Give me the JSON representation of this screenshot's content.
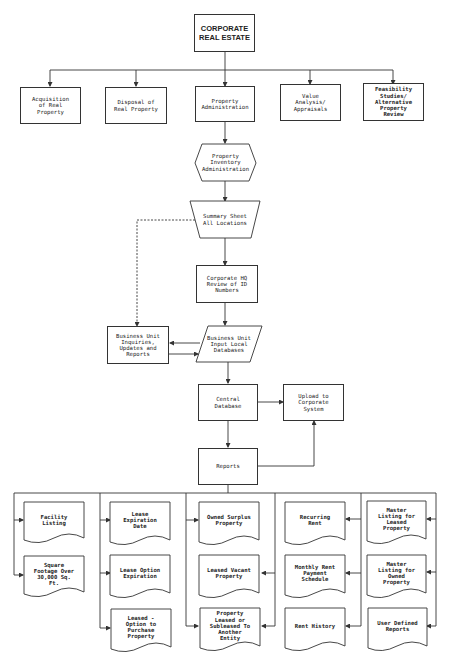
{
  "diagram": {
    "title_partial": "",
    "root": {
      "label": "CORPORATE\nREAL ESTATE"
    },
    "level1": [
      {
        "label": "Acquisition\nof Real\nProperty"
      },
      {
        "label": "Disposal of\nReal Property"
      },
      {
        "label": "Property\nAdministration"
      },
      {
        "label": "Value\nAnalysis/\nAppraisals"
      },
      {
        "label": "Feasibility\nStudies/\nAlternative\nProperty\nReview"
      }
    ],
    "flow": {
      "inventory": {
        "label": "Property\nInventory\nAdministration",
        "shape": "hexagon"
      },
      "summary": {
        "label": "Summary Sheet\nAll Locations",
        "shape": "trapezoid"
      },
      "hq_review": {
        "label": "Corporate HQ\nReview of ID\nNumbers",
        "shape": "rectangle"
      },
      "bu_inquiries": {
        "label": "Business Unit\nInquiries,\nUpdates and\nReports",
        "shape": "rectangle"
      },
      "bu_input": {
        "label": "Business Unit\nInput Local\nDatabases",
        "shape": "parallelogram"
      },
      "central_db": {
        "label": "Central\nDatabase",
        "shape": "rectangle"
      },
      "upload": {
        "label": "Upload to\nCorporate\nSystem",
        "shape": "rectangle"
      },
      "reports": {
        "label": "Reports",
        "shape": "rectangle"
      }
    },
    "report_columns": [
      {
        "items": [
          {
            "label": "Facility\nListing"
          },
          {
            "label": "Square\nFootage Over\n30,000 Sq.\nFt."
          }
        ]
      },
      {
        "items": [
          {
            "label": "Lease\nExpiration\nDate"
          },
          {
            "label": "Lease Option\nExpiration"
          },
          {
            "label": "Leased -\nOption to\nPurchase\nProperty"
          }
        ]
      },
      {
        "items": [
          {
            "label": "Owned Surplus\nProperty"
          },
          {
            "label": "Leased Vacant\nProperty"
          },
          {
            "label": "Property\nLeased or\nSubleased To\nAnother\nEntity"
          }
        ]
      },
      {
        "items": [
          {
            "label": "Recurring\nRent"
          },
          {
            "label": "Monthly Rent\nPayment\nSchedule"
          },
          {
            "label": "Rent History"
          }
        ]
      },
      {
        "items": [
          {
            "label": "Master\nListing for\nLeased\nProperty"
          },
          {
            "label": "Master\nListing for\nOwned\nProperty"
          },
          {
            "label": "User Defined\nReports"
          }
        ]
      }
    ],
    "colors": {
      "line": "#333333",
      "background": "#ffffff",
      "text": "#222222"
    }
  }
}
